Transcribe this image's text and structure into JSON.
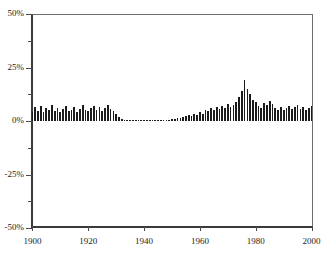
{
  "chart_data": {
    "type": "bar",
    "title": "",
    "xlabel": "",
    "ylabel": "",
    "xlim": [
      1899.5,
      2000.5
    ],
    "ylim": [
      -50,
      50
    ],
    "grid": false,
    "legend": null,
    "bar_color": "#1b1b1b",
    "axis_color": "#3a3a3a",
    "frame_color": "#6e6e6e",
    "y_ticks_major": [
      "50%",
      "25%",
      "0%",
      "-25%",
      "-50%"
    ],
    "y_ticks_major_values": [
      50,
      25,
      0,
      -25,
      -50
    ],
    "y_ticks_minor_values": [
      37.5,
      12.5,
      -12.5,
      -37.5
    ],
    "x_ticks": [
      "1900",
      "1920",
      "1940",
      "1960",
      "1980",
      "2000"
    ],
    "x_ticks_values": [
      1900,
      1920,
      1940,
      1960,
      1980,
      2000
    ],
    "x": [
      1900,
      1901,
      1902,
      1903,
      1904,
      1905,
      1906,
      1907,
      1908,
      1909,
      1910,
      1911,
      1912,
      1913,
      1914,
      1915,
      1916,
      1917,
      1918,
      1919,
      1920,
      1921,
      1922,
      1923,
      1924,
      1925,
      1926,
      1927,
      1928,
      1929,
      1930,
      1931,
      1932,
      1933,
      1934,
      1935,
      1936,
      1937,
      1938,
      1939,
      1940,
      1941,
      1942,
      1943,
      1944,
      1945,
      1946,
      1947,
      1948,
      1949,
      1950,
      1951,
      1952,
      1953,
      1954,
      1955,
      1956,
      1957,
      1958,
      1959,
      1960,
      1961,
      1962,
      1963,
      1964,
      1965,
      1966,
      1967,
      1968,
      1969,
      1970,
      1971,
      1972,
      1973,
      1974,
      1975,
      1976,
      1977,
      1978,
      1979,
      1980,
      1981,
      1982,
      1983,
      1984,
      1985,
      1986,
      1987,
      1988,
      1989,
      1990,
      1991,
      1992,
      1993,
      1994,
      1995,
      1996,
      1997,
      1998,
      1999,
      2000
    ],
    "values": [
      4.0,
      6.5,
      4.5,
      7.0,
      4.0,
      6.0,
      5.0,
      7.5,
      4.5,
      6.0,
      4.0,
      5.5,
      7.0,
      4.5,
      5.0,
      6.5,
      4.0,
      5.5,
      7.5,
      5.0,
      4.5,
      6.0,
      7.0,
      5.0,
      6.5,
      4.5,
      6.0,
      7.5,
      5.5,
      4.5,
      3.5,
      2.0,
      1.0,
      0.7,
      0.6,
      0.6,
      0.7,
      0.6,
      0.6,
      0.6,
      0.7,
      0.6,
      0.6,
      0.7,
      0.6,
      0.6,
      0.7,
      0.6,
      0.6,
      0.7,
      0.8,
      1.0,
      1.2,
      1.5,
      2.0,
      2.5,
      3.0,
      2.5,
      3.5,
      3.0,
      4.0,
      3.5,
      5.0,
      4.5,
      6.0,
      5.0,
      6.5,
      5.5,
      7.0,
      6.0,
      8.0,
      6.5,
      7.5,
      9.0,
      11.0,
      14.0,
      19.0,
      15.0,
      12.5,
      10.0,
      9.0,
      7.0,
      6.0,
      8.5,
      7.5,
      9.5,
      8.0,
      6.0,
      5.0,
      6.5,
      5.0,
      6.0,
      7.0,
      5.5,
      6.5,
      7.5,
      5.5,
      6.5,
      5.0,
      6.0,
      7.0
    ]
  }
}
